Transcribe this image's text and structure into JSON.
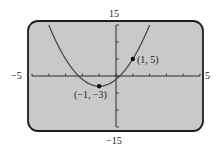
{
  "chart_data": {
    "type": "line",
    "title": "",
    "xlabel": "",
    "ylabel": "",
    "xlim": [
      -5,
      5
    ],
    "ylim": [
      -15,
      15
    ],
    "x_ticks_step": 1,
    "y_ticks_step": 5,
    "grid": false,
    "series": [
      {
        "name": "y = 2x^2 + 4x - 1",
        "equation": "2*(x+1)^2 - 3",
        "x": [
          -4.5,
          -4,
          -3.5,
          -3,
          -2.5,
          -2,
          -1.5,
          -1,
          -0.5,
          0,
          0.5,
          1,
          1.5,
          2
        ],
        "y": [
          11.5,
          15,
          9.5,
          5,
          1.5,
          -1,
          -2.5,
          -3,
          -2.5,
          -1,
          1.5,
          5,
          9.5,
          15
        ]
      }
    ],
    "points": [
      {
        "x": -1,
        "y": -3,
        "label": "(−1, −3)"
      },
      {
        "x": 1,
        "y": 5,
        "label": "(1, 5)"
      }
    ],
    "axis_labels": {
      "x_min": "−5",
      "x_max": "5",
      "y_max": "15",
      "y_min": "−15"
    }
  },
  "colors": {
    "screen_bg": "#c9c9c9",
    "frame": "#1e1e1e",
    "curve": "#4a4a4a",
    "axis": "#2a2a2a"
  }
}
